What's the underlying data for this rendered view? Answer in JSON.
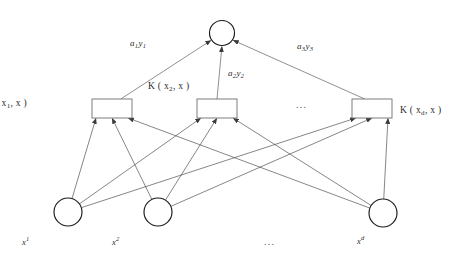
{
  "figure": {
    "kind": "neural-network-diagram",
    "title": "",
    "background_color": "#ffffff",
    "width": 466,
    "height": 260
  },
  "colors": {
    "node_stroke": "#1a1a1a",
    "box_stroke": "#6f6f6f",
    "edge_stroke": "#3a3a3a",
    "text": "#2b2b2b",
    "ellipsis": "#5a5a5a"
  },
  "output_node": {
    "name": "output-node",
    "cx": 222,
    "cy": 33,
    "r": 12.5,
    "label": ""
  },
  "kernel_layer": {
    "nodes": [
      {
        "id": "k1",
        "x": 92,
        "y": 99,
        "w": 40,
        "h": 19,
        "label_prefix": "K (",
        "label_var": "x",
        "label_sub": "1",
        "label_suffix": ", x )",
        "label_text": "K ( x1, x )",
        "label_pos": {
          "x": 27,
          "y": 99
        },
        "label_align": "right"
      },
      {
        "id": "k2",
        "x": 197,
        "y": 99,
        "w": 40,
        "h": 19,
        "label_prefix": "K (",
        "label_var": "x",
        "label_sub": "2",
        "label_suffix": ", x )",
        "label_text": "K ( x2, x )",
        "label_pos": {
          "x": 148,
          "y": 82
        },
        "label_align": "left"
      },
      {
        "id": "k3",
        "x": 352,
        "y": 99,
        "w": 40,
        "h": 19,
        "label_prefix": "K (",
        "label_var": "x",
        "label_sub": "d",
        "label_suffix": ", x )",
        "label_text": "K ( xd, x )",
        "label_pos": {
          "x": 400,
          "y": 106
        },
        "label_align": "left"
      }
    ],
    "ellipsis": {
      "text": "...",
      "x": 296,
      "y": 100
    }
  },
  "input_layer": {
    "nodes": [
      {
        "id": "i1",
        "cx": 68,
        "cy": 212,
        "r": 14,
        "label_var": "x",
        "label_sup": "1",
        "label_text": "x1",
        "label_pos": {
          "x": 22,
          "y": 236
        }
      },
      {
        "id": "i2",
        "cx": 158,
        "cy": 212,
        "r": 14,
        "label_var": "x",
        "label_sup": "2",
        "label_text": "x2",
        "label_pos": {
          "x": 112,
          "y": 236
        }
      },
      {
        "id": "i3",
        "cx": 383,
        "cy": 213,
        "r": 14,
        "label_var": "x",
        "label_sup": "d",
        "label_text": "xd",
        "label_pos": {
          "x": 357,
          "y": 235
        }
      }
    ],
    "ellipsis": {
      "text": "...",
      "x": 264,
      "y": 237
    }
  },
  "weights": [
    {
      "id": "w1",
      "var": "a",
      "sub": "1",
      "var2": "y",
      "sub2": "1",
      "text": "a1y1",
      "x": 130,
      "y": 39,
      "from": "k1",
      "to": "output-node"
    },
    {
      "id": "w2",
      "var": "a",
      "sub": "2",
      "var2": "y",
      "sub2": "2",
      "text": "a2y2",
      "x": 228,
      "y": 69,
      "from": "k2",
      "to": "output-node"
    },
    {
      "id": "w3",
      "var": "a",
      "sub": "3",
      "var2": "y",
      "sub2": "3",
      "text": "a3y3",
      "x": 297,
      "y": 42,
      "from": "k3",
      "to": "output-node"
    }
  ],
  "edges": {
    "input_to_kernel": [
      {
        "from": "i1",
        "to": "k1"
      },
      {
        "from": "i1",
        "to": "k2"
      },
      {
        "from": "i1",
        "to": "k3"
      },
      {
        "from": "i2",
        "to": "k1"
      },
      {
        "from": "i2",
        "to": "k2"
      },
      {
        "from": "i2",
        "to": "k3"
      },
      {
        "from": "i3",
        "to": "k1"
      },
      {
        "from": "i3",
        "to": "k2"
      },
      {
        "from": "i3",
        "to": "k3"
      }
    ],
    "kernel_to_output": [
      {
        "from": "k1",
        "to": "output-node"
      },
      {
        "from": "k2",
        "to": "output-node"
      },
      {
        "from": "k3",
        "to": "output-node"
      }
    ]
  }
}
